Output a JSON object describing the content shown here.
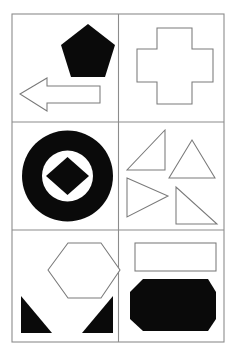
{
  "page": {
    "background_color": "#ffffff",
    "width": 236,
    "height": 356
  },
  "frame": {
    "name": "outer-border",
    "stroke_color": "#8c8c8c",
    "fill_color": "#ffffff",
    "x": 12,
    "y": 14,
    "width": 212,
    "height": 328,
    "columns": 2,
    "rows": 3,
    "column_divider_x": [
      118.5
    ],
    "row_divider_y": [
      122,
      230
    ]
  },
  "cells": [
    {
      "id": "cell-1",
      "label": "top-left",
      "row": 0,
      "col": 0,
      "shape_count": 2,
      "shapes": [
        {
          "name": "pentagon",
          "style": "filled",
          "color": "#0a0a0a",
          "points": "88,24 115,45 105,77 71,77 61,45"
        },
        {
          "name": "left-arrow",
          "style": "outline",
          "color": "#7a7a7a",
          "points": "20,94 47,78 47,86 100,86 100,103 47,103 47,111"
        }
      ]
    },
    {
      "id": "cell-2",
      "label": "top-right",
      "row": 0,
      "col": 1,
      "shape_count": 1,
      "shapes": [
        {
          "name": "cross",
          "style": "outline",
          "color": "#7a7a7a",
          "points": "157,28 192,28 192,49 213,49 213,82 192,82 192,104 157,104 157,82 137,82 137,49 157,49"
        }
      ]
    },
    {
      "id": "cell-3",
      "label": "middle-left",
      "row": 1,
      "col": 0,
      "shape_count": 3,
      "shapes": [
        {
          "name": "donut-circle-outer",
          "style": "filled",
          "color": "#0a0a0a",
          "cx": 67.5,
          "cy": 176,
          "r": 45.5
        },
        {
          "name": "donut-circle-hole",
          "style": "hole",
          "color": "#ffffff",
          "cx": 67.5,
          "cy": 176,
          "r": 25.5
        },
        {
          "name": "diamond",
          "style": "filled",
          "color": "#0a0a0a",
          "points": "67.5,157 89,176 67.5,195 46,176"
        }
      ]
    },
    {
      "id": "cell-4",
      "label": "middle-right",
      "row": 1,
      "col": 1,
      "shape_count": 4,
      "shapes": [
        {
          "name": "triangle-right-angle-upper-left",
          "style": "outline",
          "color": "#7a7a7a",
          "points": "165,130 165,170 127,170"
        },
        {
          "name": "triangle-isoceles-up",
          "style": "outline",
          "color": "#7a7a7a",
          "points": "192,140 215,178 169,178"
        },
        {
          "name": "triangle-pointing-right",
          "style": "outline",
          "color": "#7a7a7a",
          "points": "127,178 168,196 127,217"
        },
        {
          "name": "triangle-right-angle-lower-right",
          "style": "outline",
          "color": "#7a7a7a",
          "points": "176,187 176,224 217,224"
        }
      ]
    },
    {
      "id": "cell-5",
      "label": "bottom-left",
      "row": 2,
      "col": 0,
      "shape_count": 3,
      "shapes": [
        {
          "name": "hexagon",
          "style": "outline",
          "color": "#7a7a7a",
          "points": "48,270 68,243 101,243 120,270 101,298 68,298"
        },
        {
          "name": "triangle-filled-bottom-left",
          "style": "filled",
          "color": "#0a0a0a",
          "points": "21,296 52,333 21,333"
        },
        {
          "name": "triangle-filled-bottom-right",
          "style": "filled",
          "color": "#0a0a0a",
          "points": "113,296 113,333 82,333"
        }
      ]
    },
    {
      "id": "cell-6",
      "label": "bottom-right",
      "row": 2,
      "col": 1,
      "shape_count": 2,
      "shapes": [
        {
          "name": "rectangle",
          "style": "outline",
          "color": "#7a7a7a",
          "x": 135,
          "y": 243,
          "width": 81,
          "height": 28
        },
        {
          "name": "octagon",
          "style": "filled",
          "color": "#0a0a0a",
          "points": "143,279 208,279 216,292 216,319 208,331 143,331 130,319 130,292"
        }
      ]
    }
  ]
}
